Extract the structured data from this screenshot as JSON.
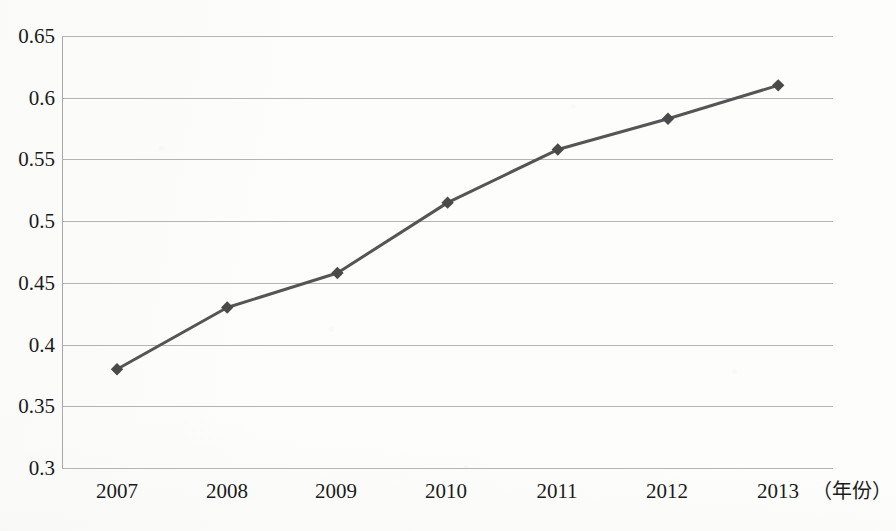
{
  "chart_data": {
    "type": "line",
    "title": "",
    "xlabel": "（年份）",
    "ylabel": "",
    "categories": [
      "2007",
      "2008",
      "2009",
      "2010",
      "2011",
      "2012",
      "2013"
    ],
    "x": [
      2007,
      2008,
      2009,
      2010,
      2011,
      2012,
      2013
    ],
    "values": [
      0.38,
      0.43,
      0.458,
      0.515,
      0.558,
      0.583,
      0.61
    ],
    "series": [
      {
        "name": "",
        "values": [
          0.38,
          0.43,
          0.458,
          0.515,
          0.558,
          0.583,
          0.61
        ]
      }
    ],
    "ylim": [
      0.3,
      0.65
    ],
    "ytick_labels": [
      "0.3",
      "0.35",
      "0.4",
      "0.45",
      "0.5",
      "0.55",
      "0.6",
      "0.65"
    ],
    "ytick_values": [
      0.3,
      0.35,
      0.4,
      0.45,
      0.5,
      0.55,
      0.6,
      0.65
    ],
    "grid": true,
    "legend": false,
    "legend_position": "none",
    "marker": "diamond",
    "line_color": "#555555",
    "marker_color": "#4a4a4a",
    "grid_color": "#b4b4b4",
    "background_color": "#fdfdfc"
  }
}
